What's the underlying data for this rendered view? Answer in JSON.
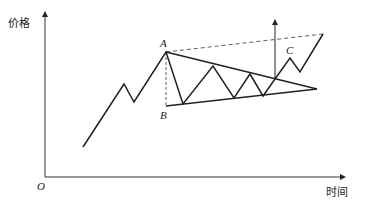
{
  "diagram": {
    "type": "descending triangle breakout chart",
    "y_axis_label": "价格",
    "x_axis_label": "时间",
    "origin_label": "O",
    "points": {
      "A": "A",
      "B": "B",
      "C": "C"
    },
    "price_path": [
      [
        83,
        147
      ],
      [
        124,
        84
      ],
      [
        134,
        102
      ],
      [
        166,
        52
      ],
      [
        183,
        104
      ],
      [
        213,
        66
      ],
      [
        234,
        98
      ],
      [
        250,
        74
      ],
      [
        263,
        96
      ],
      [
        275,
        79
      ],
      [
        290,
        58
      ],
      [
        300,
        72
      ],
      [
        323,
        34
      ]
    ],
    "upper_trendline": [
      [
        166,
        52
      ],
      [
        317,
        89
      ]
    ],
    "lower_trendline": [
      [
        166,
        106
      ],
      [
        317,
        89
      ]
    ],
    "colors": {
      "line": "#222222",
      "background": "#ffffff"
    }
  }
}
